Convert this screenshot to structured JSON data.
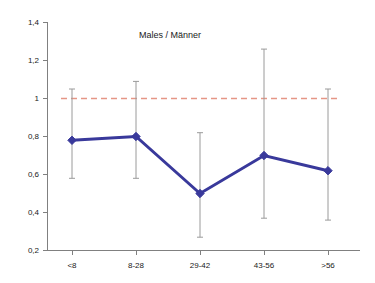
{
  "chart_data": {
    "type": "line",
    "title": "Males / Männer",
    "xlabel": "",
    "ylabel": "",
    "categories": [
      "<8",
      "8-28",
      "29-42",
      "43-56",
      ">56"
    ],
    "values": [
      0.78,
      0.8,
      0.5,
      0.7,
      0.62
    ],
    "error_low": [
      0.58,
      0.58,
      0.27,
      0.37,
      0.36
    ],
    "error_high": [
      1.05,
      1.09,
      0.82,
      1.26,
      1.05
    ],
    "ylim": [
      0.2,
      1.4
    ],
    "ytick_labels": [
      "0,2",
      "0,4",
      "0,6",
      "0,8",
      "1",
      "1,2",
      "1,4"
    ],
    "ytick_values": [
      0.2,
      0.4,
      0.6,
      0.8,
      1.0,
      1.2,
      1.4
    ],
    "reference_line": {
      "value": 1.0,
      "style": "dashed",
      "color": "#e59686"
    },
    "grid": false,
    "legend": null,
    "series_color": "#39399b",
    "errorbar_color": "#9a9a9a",
    "axis_color": "#808080",
    "marker": "diamond"
  }
}
